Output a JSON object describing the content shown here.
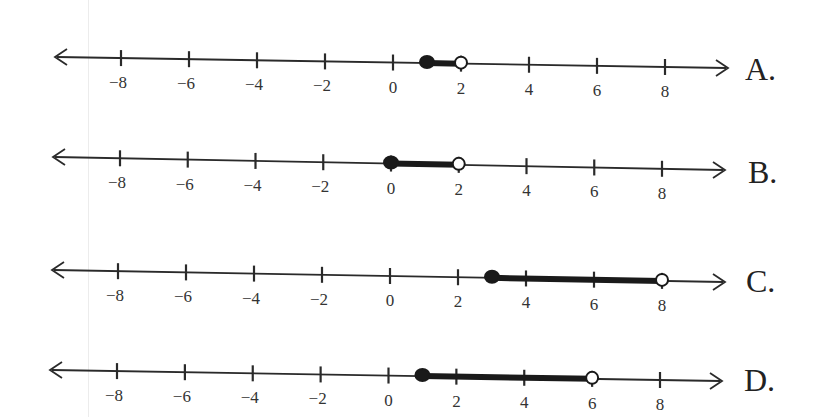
{
  "chart_data": {
    "type": "number_line",
    "title": "",
    "axis": {
      "min": -8,
      "max": 8,
      "tick_step": 2,
      "tick_labels": [
        "−8",
        "−6",
        "−4",
        "−2",
        "0",
        "2",
        "4",
        "6",
        "8"
      ],
      "arrows_both_ends": true
    },
    "options": [
      {
        "label": "A.",
        "start": 1,
        "start_closed": true,
        "end": 2,
        "end_closed": false,
        "interval": "[1, 2)"
      },
      {
        "label": "B.",
        "start": 0,
        "start_closed": true,
        "end": 2,
        "end_closed": false,
        "interval": "[0, 2)"
      },
      {
        "label": "C.",
        "start": 3,
        "start_closed": true,
        "end": 8,
        "end_closed": false,
        "interval": "[3, 8)"
      },
      {
        "label": "D.",
        "start": 1,
        "start_closed": true,
        "end": 6,
        "end_closed": false,
        "interval": "[1, 6)"
      }
    ]
  },
  "lines": [
    {
      "label": "A.",
      "y_left": 57,
      "y_right": 68,
      "x_arrow_left": 55,
      "x_arrow_right": 728,
      "x_neg8": 121,
      "x_pos8": 665,
      "label_x": 745,
      "label_y": 80
    },
    {
      "label": "B.",
      "y_left": 157,
      "y_right": 170,
      "x_arrow_left": 53,
      "x_arrow_right": 725,
      "x_neg8": 120,
      "x_pos8": 662,
      "label_x": 748,
      "label_y": 183
    },
    {
      "label": "C.",
      "y_left": 270,
      "y_right": 282,
      "x_arrow_left": 52,
      "x_arrow_right": 725,
      "x_neg8": 118,
      "x_pos8": 662,
      "label_x": 746,
      "label_y": 292
    },
    {
      "label": "D.",
      "y_left": 370,
      "y_right": 381,
      "x_arrow_left": 50,
      "x_arrow_right": 722,
      "x_neg8": 117,
      "x_pos8": 660,
      "label_x": 744,
      "label_y": 391
    }
  ],
  "colors": {
    "line": "#2a2a2a",
    "fill": "#1a1a1a",
    "open_fill": "#ffffff"
  }
}
